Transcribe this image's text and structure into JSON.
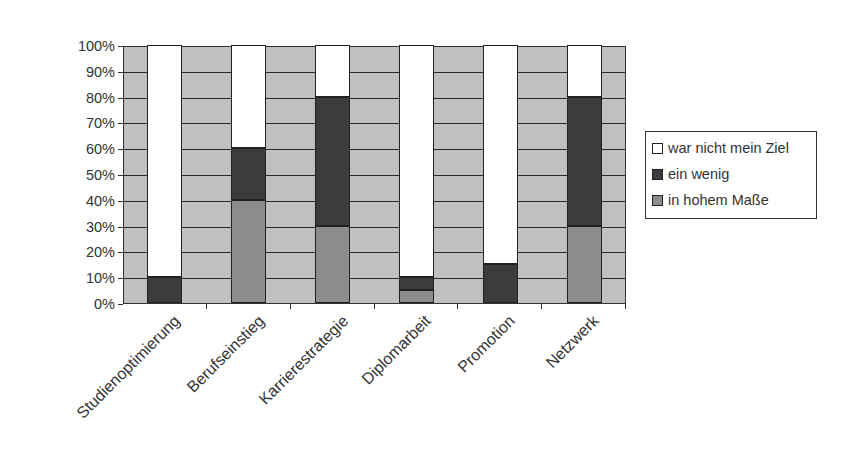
{
  "chart_data": {
    "type": "bar",
    "stacked": true,
    "percent": true,
    "title": "",
    "xlabel": "",
    "ylabel": "",
    "ylim": [
      0,
      100
    ],
    "yticks": [
      "0%",
      "10%",
      "20%",
      "30%",
      "40%",
      "50%",
      "60%",
      "70%",
      "80%",
      "90%",
      "100%"
    ],
    "grid": true,
    "legend_position": "right",
    "categories": [
      "Studienoptimierung",
      "Berufseinstieg",
      "Karrierestrategie",
      "Diplomarbeit",
      "Promotion",
      "Netzwerk"
    ],
    "series": [
      {
        "name": "in hohem Maße",
        "color": "#8c8c8c",
        "values": [
          0,
          40,
          30,
          5,
          0,
          30
        ]
      },
      {
        "name": "ein wenig",
        "color": "#3c3c3c",
        "values": [
          10,
          20,
          50,
          5,
          15,
          50
        ]
      },
      {
        "name": "war nicht mein Ziel",
        "color": "#ffffff",
        "values": [
          90,
          40,
          20,
          90,
          85,
          20
        ]
      }
    ],
    "legend": [
      "war nicht mein Ziel",
      "ein wenig",
      "in hohem Maße"
    ]
  },
  "colors": {
    "plot_background": "#c0c0c0",
    "gridline": "#2a2a2a"
  }
}
